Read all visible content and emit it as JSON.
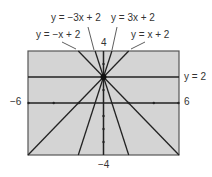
{
  "window": {
    "xmin": -6,
    "xmax": 6,
    "ymin": -4,
    "ymax": 4
  },
  "labels": {
    "xmin": "−6",
    "xmax": "6",
    "ymax": "4",
    "ymin": "−4"
  },
  "equations": [
    {
      "id": "neg3",
      "text": "y = −3x + 2",
      "slope": -3,
      "intercept": 2
    },
    {
      "id": "pos3",
      "text": "y = 3x + 2",
      "slope": 3,
      "intercept": 2
    },
    {
      "id": "neg1",
      "text": "y = −x + 2",
      "slope": -1,
      "intercept": 2
    },
    {
      "id": "pos1",
      "text": "y = x + 2",
      "slope": 1,
      "intercept": 2
    },
    {
      "id": "horiz",
      "text": "y = 2",
      "slope": 0,
      "intercept": 2
    }
  ],
  "colors": {
    "screen": "#d4d4d4",
    "line": "#222222",
    "frame": "#555555"
  }
}
